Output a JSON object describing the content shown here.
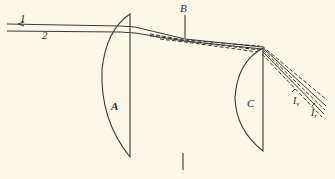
{
  "diagram": {
    "type": "optics-ray-diagram",
    "background_color": "#fbf8e6",
    "line_color": "#3a3a3a",
    "labels": {
      "ray1": "1",
      "ray2": "2",
      "lens_a": "A",
      "point_b": "B",
      "lens_c": "C",
      "violet_ray": "I",
      "violet_sub": "v",
      "red_ray": "I",
      "red_sub": "r"
    },
    "elements": [
      {
        "id": "ray-1",
        "kind": "incident-ray",
        "label": "1"
      },
      {
        "id": "ray-2",
        "kind": "incident-ray",
        "label": "2"
      },
      {
        "id": "lens-a",
        "kind": "plano-convex-lens",
        "label": "A"
      },
      {
        "id": "point-b",
        "kind": "focal-point-marker",
        "label": "B"
      },
      {
        "id": "lens-c",
        "kind": "plano-convex-lens",
        "label": "C"
      },
      {
        "id": "ray-iv",
        "kind": "dispersed-ray-violet",
        "label": "Iv"
      },
      {
        "id": "ray-ir",
        "kind": "dispersed-ray-red",
        "label": "Ir"
      },
      {
        "id": "tick-mark",
        "kind": "vertical-marker",
        "label": ""
      }
    ]
  }
}
